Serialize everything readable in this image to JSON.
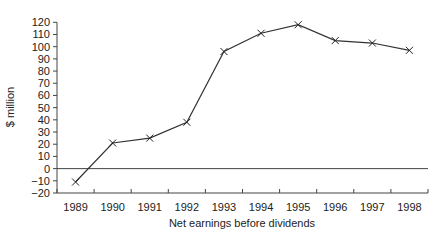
{
  "chart_data": {
    "type": "line",
    "title": "",
    "xlabel": "Net earnings before dividends",
    "ylabel": "$ million",
    "categories": [
      "1989",
      "1990",
      "1991",
      "1992",
      "1993",
      "1994",
      "1995",
      "1996",
      "1997",
      "1998"
    ],
    "series": [
      {
        "name": "Net earnings before dividends",
        "values": [
          -11,
          21,
          25,
          38,
          96,
          111,
          118,
          105,
          103,
          97
        ],
        "marker": "x"
      }
    ],
    "ylim": [
      -20,
      120
    ],
    "yticks": [
      -20,
      -10,
      0,
      10,
      20,
      30,
      40,
      50,
      60,
      70,
      80,
      90,
      100,
      110,
      120
    ],
    "grid": false,
    "zero_line": true,
    "legend": "none",
    "line_color": "#333333"
  }
}
